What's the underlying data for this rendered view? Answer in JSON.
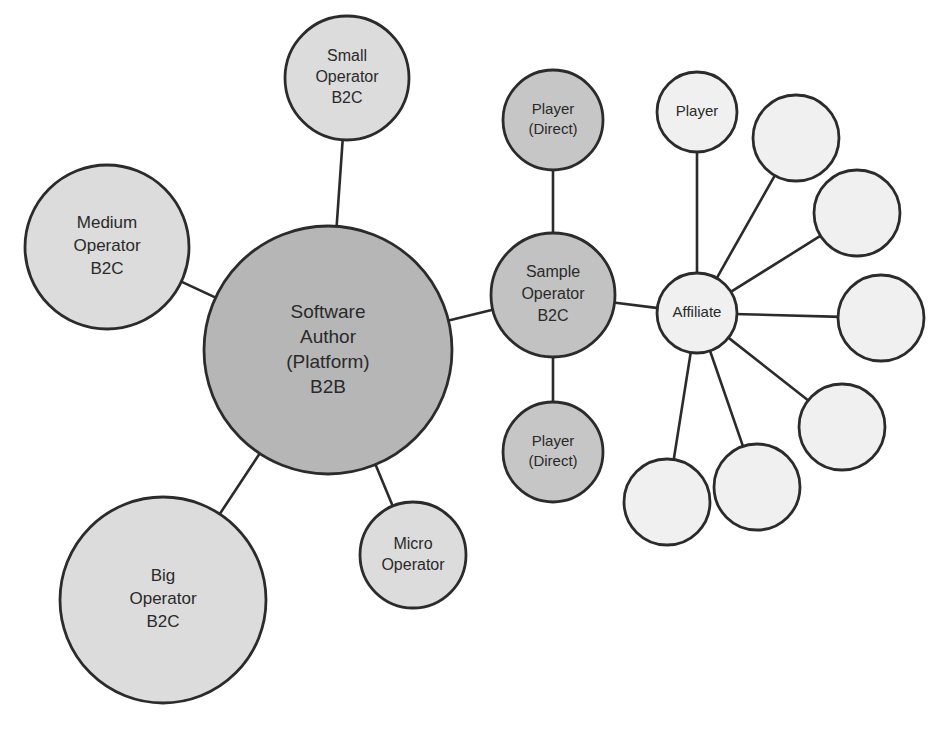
{
  "diagram": {
    "type": "node-link-network",
    "canvas": {
      "width": 942,
      "height": 733,
      "background": "#ffffff"
    },
    "palette": {
      "dark_gray": "#b6b6b6",
      "medium_gray": "#cccccc",
      "light_gray": "#dcdcdc",
      "very_light_gray": "#f0f0f0",
      "outline": "#2b2b2b",
      "text": "#2a2a2a"
    },
    "nodes": [
      {
        "id": "software-author",
        "lines": [
          "Software",
          "Author",
          "(Platform)",
          "B2B"
        ],
        "cx": 328,
        "cy": 350,
        "r": 124,
        "fill": "#b6b6b6",
        "font_size": 19,
        "line_height": 25
      },
      {
        "id": "medium-operator",
        "lines": [
          "Medium",
          "Operator",
          "B2C"
        ],
        "cx": 107,
        "cy": 247,
        "r": 82,
        "fill": "#dcdcdc",
        "font_size": 17,
        "line_height": 23
      },
      {
        "id": "small-operator",
        "lines": [
          "Small",
          "Operator",
          "B2C"
        ],
        "cx": 347,
        "cy": 78,
        "r": 62,
        "fill": "#dcdcdc",
        "font_size": 16,
        "line_height": 21
      },
      {
        "id": "big-operator",
        "lines": [
          "Big",
          "Operator",
          "B2C"
        ],
        "cx": 163,
        "cy": 600,
        "r": 103,
        "fill": "#dcdcdc",
        "font_size": 17,
        "line_height": 23
      },
      {
        "id": "micro-operator",
        "lines": [
          "Micro",
          "Operator"
        ],
        "cx": 413,
        "cy": 555,
        "r": 53,
        "fill": "#dcdcdc",
        "font_size": 16,
        "line_height": 21
      },
      {
        "id": "sample-operator",
        "lines": [
          "Sample",
          "Operator",
          "B2C"
        ],
        "cx": 553,
        "cy": 295,
        "r": 62,
        "fill": "#c2c2c2",
        "font_size": 16,
        "line_height": 22
      },
      {
        "id": "player-direct-top",
        "lines": [
          "Player",
          "(Direct)"
        ],
        "cx": 553,
        "cy": 120,
        "r": 50,
        "fill": "#c6c6c6",
        "font_size": 15,
        "line_height": 20
      },
      {
        "id": "player-direct-bottom",
        "lines": [
          "Player",
          "(Direct)"
        ],
        "cx": 553,
        "cy": 452,
        "r": 50,
        "fill": "#c6c6c6",
        "font_size": 15,
        "line_height": 20
      },
      {
        "id": "affiliate",
        "lines": [
          "Affiliate"
        ],
        "cx": 697,
        "cy": 313,
        "r": 40,
        "fill": "#f0f0f0",
        "font_size": 15,
        "line_height": 19
      },
      {
        "id": "player-affiliate",
        "lines": [
          "Player"
        ],
        "cx": 697,
        "cy": 112,
        "r": 40,
        "fill": "#f0f0f0",
        "font_size": 15,
        "line_height": 19
      },
      {
        "id": "affiliate-sub-1",
        "lines": [],
        "cx": 796,
        "cy": 138,
        "r": 43,
        "fill": "#f0f0f0",
        "font_size": 15,
        "line_height": 19
      },
      {
        "id": "affiliate-sub-2",
        "lines": [],
        "cx": 857,
        "cy": 213,
        "r": 43,
        "fill": "#f0f0f0",
        "font_size": 15,
        "line_height": 19
      },
      {
        "id": "affiliate-sub-3",
        "lines": [],
        "cx": 881,
        "cy": 318,
        "r": 43,
        "fill": "#f0f0f0",
        "font_size": 15,
        "line_height": 19
      },
      {
        "id": "affiliate-sub-4",
        "lines": [],
        "cx": 842,
        "cy": 427,
        "r": 43,
        "fill": "#f0f0f0",
        "font_size": 15,
        "line_height": 19
      },
      {
        "id": "affiliate-sub-5",
        "lines": [],
        "cx": 757,
        "cy": 487,
        "r": 43,
        "fill": "#f0f0f0",
        "font_size": 15,
        "line_height": 19
      },
      {
        "id": "affiliate-sub-6",
        "lines": [],
        "cx": 667,
        "cy": 502,
        "r": 43,
        "fill": "#f0f0f0",
        "font_size": 15,
        "line_height": 19
      }
    ],
    "edges": [
      {
        "id": "edge-software-author-small-operator",
        "source": "software-author",
        "target": "small-operator"
      },
      {
        "id": "edge-software-author-medium-operator",
        "source": "software-author",
        "target": "medium-operator"
      },
      {
        "id": "edge-software-author-big-operator",
        "source": "software-author",
        "target": "big-operator"
      },
      {
        "id": "edge-software-author-micro-operator",
        "source": "software-author",
        "target": "micro-operator"
      },
      {
        "id": "edge-software-author-sample-operator",
        "source": "software-author",
        "target": "sample-operator"
      },
      {
        "id": "edge-sample-operator-player-direct-top",
        "source": "sample-operator",
        "target": "player-direct-top"
      },
      {
        "id": "edge-sample-operator-player-direct-bottom",
        "source": "sample-operator",
        "target": "player-direct-bottom"
      },
      {
        "id": "edge-sample-operator-affiliate",
        "source": "sample-operator",
        "target": "affiliate"
      },
      {
        "id": "edge-affiliate-player",
        "source": "affiliate",
        "target": "player-affiliate"
      },
      {
        "id": "edge-affiliate-sub-1",
        "source": "affiliate",
        "target": "affiliate-sub-1"
      },
      {
        "id": "edge-affiliate-sub-2",
        "source": "affiliate",
        "target": "affiliate-sub-2"
      },
      {
        "id": "edge-affiliate-sub-3",
        "source": "affiliate",
        "target": "affiliate-sub-3"
      },
      {
        "id": "edge-affiliate-sub-4",
        "source": "affiliate",
        "target": "affiliate-sub-4"
      },
      {
        "id": "edge-affiliate-sub-5",
        "source": "affiliate",
        "target": "affiliate-sub-5"
      },
      {
        "id": "edge-affiliate-sub-6",
        "source": "affiliate",
        "target": "affiliate-sub-6"
      }
    ]
  }
}
